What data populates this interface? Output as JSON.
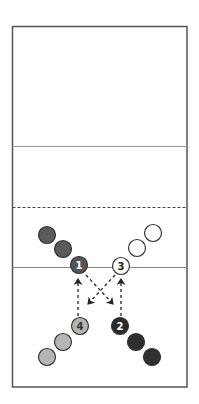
{
  "diagram": {
    "type": "volleyball-court-drill",
    "court": {
      "frame": {
        "x": 12.5,
        "y": 26.5,
        "width": 174.5,
        "height": 360.5,
        "stroke": "#555555"
      },
      "lines": [
        {
          "name": "attack-line-top",
          "y": 146.5,
          "style": "solid",
          "stroke": "#999999"
        },
        {
          "name": "dashed-line",
          "y": 207.5,
          "style": "dashed",
          "stroke": "#444444"
        },
        {
          "name": "center-line",
          "y": 267.5,
          "style": "solid",
          "stroke": "#888888"
        }
      ]
    },
    "colors": {
      "dark_team": "#5a5a5a",
      "white_team": "#ffffff",
      "light_team": "#b5b5b5",
      "black_team": "#2b2b2b",
      "outline": "#333333",
      "arrow": "#222222"
    },
    "players": [
      {
        "id": "p1",
        "label": "1",
        "x": 79,
        "y": 265,
        "fill": "#555555",
        "text": "#ffffff"
      },
      {
        "id": "p1b",
        "label": "",
        "x": 63,
        "y": 249,
        "fill": "#5a5a5a",
        "text": ""
      },
      {
        "id": "p1c",
        "label": "",
        "x": 47,
        "y": 235,
        "fill": "#5a5a5a",
        "text": ""
      },
      {
        "id": "p3",
        "label": "3",
        "x": 121,
        "y": 266,
        "fill": "#ffffff",
        "text": "#222222"
      },
      {
        "id": "p3b",
        "label": "",
        "x": 137,
        "y": 248,
        "fill": "#ffffff",
        "text": ""
      },
      {
        "id": "p3c",
        "label": "",
        "x": 153,
        "y": 233,
        "fill": "#ffffff",
        "text": ""
      },
      {
        "id": "p4",
        "label": "4",
        "x": 80,
        "y": 326,
        "fill": "#b3b3b3",
        "text": "#333333"
      },
      {
        "id": "p4b",
        "label": "",
        "x": 63,
        "y": 342,
        "fill": "#b5b5b5",
        "text": ""
      },
      {
        "id": "p4c",
        "label": "",
        "x": 47,
        "y": 357,
        "fill": "#b5b5b5",
        "text": ""
      },
      {
        "id": "p2",
        "label": "2",
        "x": 120,
        "y": 326,
        "fill": "#2b2b2b",
        "text": "#ffffff"
      },
      {
        "id": "p2b",
        "label": "",
        "x": 136,
        "y": 342,
        "fill": "#2f2f2f",
        "text": ""
      },
      {
        "id": "p2c",
        "label": "",
        "x": 152,
        "y": 357,
        "fill": "#2f2f2f",
        "text": ""
      }
    ],
    "arrows": [
      {
        "name": "arrow-4-to-1",
        "from": [
          78,
          316
        ],
        "to": [
          78,
          279
        ]
      },
      {
        "name": "arrow-2-to-3",
        "from": [
          121,
          316
        ],
        "to": [
          121,
          279
        ]
      },
      {
        "name": "arrow-1-to-2",
        "from": [
          86,
          275
        ],
        "to": [
          113,
          304
        ]
      },
      {
        "name": "arrow-3-to-4",
        "from": [
          115,
          275
        ],
        "to": [
          88,
          304
        ]
      }
    ]
  }
}
